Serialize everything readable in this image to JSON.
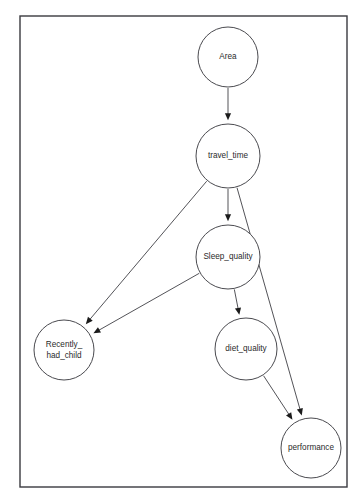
{
  "diagram": {
    "background_color": "#ffffff",
    "frame": {
      "x": 20,
      "y": 16,
      "width": 327,
      "height": 471,
      "stroke_color": "#3a3a3f"
    },
    "node_style": {
      "fill_color": "#ffffff",
      "stroke_color": "#4a4a4f",
      "text_color": "#2b2b2b"
    },
    "edge_style": {
      "stroke_color": "#4a4a4f",
      "arrow_color": "#1b1b1b"
    }
  },
  "chart_data": {
    "type": "diagram",
    "graph_kind": "directed-acyclic-graph",
    "nodes": [
      {
        "id": "Area",
        "label": "Area",
        "lines": [
          "Area"
        ],
        "cx": 228,
        "cy": 57,
        "r": 30
      },
      {
        "id": "travel_time",
        "label": "travel_time",
        "lines": [
          "travel_time"
        ],
        "cx": 228,
        "cy": 156,
        "r": 32
      },
      {
        "id": "Sleep_quality",
        "label": "Sleep_quality",
        "lines": [
          "Sleep_quality"
        ],
        "cx": 228,
        "cy": 257,
        "r": 32
      },
      {
        "id": "Recently_had_child",
        "label": "Recently_ had_child",
        "lines": [
          "Recently_",
          "had_child"
        ],
        "cx": 64,
        "cy": 350,
        "r": 30
      },
      {
        "id": "diet_quality",
        "label": "diet_quality",
        "lines": [
          "diet_quality"
        ],
        "cx": 246,
        "cy": 349,
        "r": 31
      },
      {
        "id": "performance",
        "label": "performance",
        "lines": [
          "performance"
        ],
        "cx": 311,
        "cy": 448,
        "r": 30
      }
    ],
    "edges": [
      {
        "id": "e1",
        "from": "Area",
        "to": "travel_time",
        "directed": true
      },
      {
        "id": "e2",
        "from": "travel_time",
        "to": "Sleep_quality",
        "directed": true
      },
      {
        "id": "e3",
        "from": "travel_time",
        "to": "Recently_had_child",
        "directed": true
      },
      {
        "id": "e4",
        "from": "travel_time",
        "to": "performance",
        "directed": true
      },
      {
        "id": "e5",
        "from": "Sleep_quality",
        "to": "Recently_had_child",
        "directed": true
      },
      {
        "id": "e6",
        "from": "Sleep_quality",
        "to": "diet_quality",
        "directed": true
      },
      {
        "id": "e7",
        "from": "diet_quality",
        "to": "performance",
        "directed": true
      }
    ]
  }
}
